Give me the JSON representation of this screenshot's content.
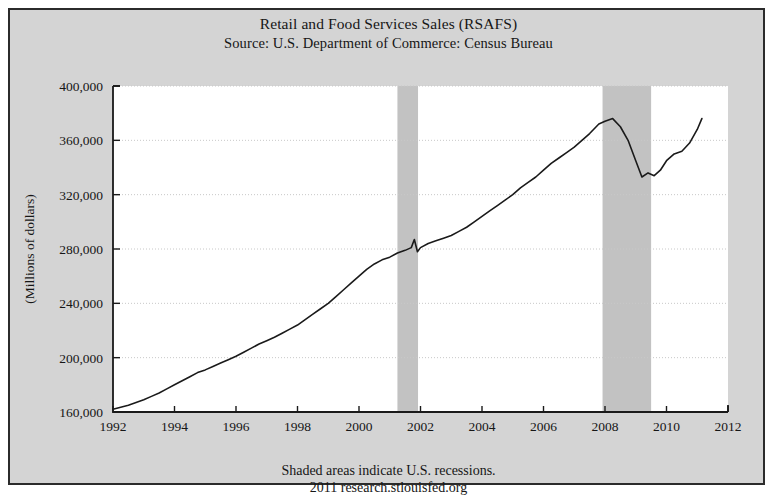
{
  "header": {
    "title": "Retail and Food Services Sales (RSAFS)",
    "source": "Source: U.S. Department of Commerce: Census Bureau"
  },
  "footer": {
    "note": "Shaded areas indicate U.S. recessions.",
    "attribution": "2011 research.stlouisfed.org"
  },
  "colors": {
    "figure_background": "#d4d4d4",
    "plot_background": "#ffffff",
    "line": "#1a1a1a",
    "recession_band": "#c2c2c2",
    "gridline": "#c8c8c8",
    "axis": "#1a1a1a",
    "text": "#161616"
  },
  "chart_data": {
    "type": "line",
    "title": "Retail and Food Services Sales (RSAFS)",
    "subtitle": "Source: U.S. Department of Commerce: Census Bureau",
    "xlabel": "",
    "ylabel": "(Millions of dollars)",
    "xlim": [
      1992,
      2012
    ],
    "ylim": [
      160000,
      400000
    ],
    "xticks": [
      1992,
      1994,
      1996,
      1998,
      2000,
      2002,
      2004,
      2006,
      2008,
      2010,
      2012
    ],
    "xtick_labels": [
      "1992",
      "1994",
      "1996",
      "1998",
      "2000",
      "2002",
      "2004",
      "2006",
      "2008",
      "2010",
      "2012"
    ],
    "yticks": [
      160000,
      200000,
      240000,
      280000,
      320000,
      360000,
      400000
    ],
    "ytick_labels": [
      "160,000",
      "200,000",
      "240,000",
      "280,000",
      "320,000",
      "360,000",
      "400,000"
    ],
    "grid": true,
    "legend": null,
    "series": [
      {
        "name": "RSAFS",
        "units": "Millions of dollars",
        "x": [
          1992.0,
          1992.25,
          1992.5,
          1992.75,
          1993.0,
          1993.25,
          1993.5,
          1993.75,
          1994.0,
          1994.25,
          1994.5,
          1994.75,
          1995.0,
          1995.25,
          1995.5,
          1995.75,
          1996.0,
          1996.25,
          1996.5,
          1996.75,
          1997.0,
          1997.25,
          1997.5,
          1997.75,
          1998.0,
          1998.25,
          1998.5,
          1998.75,
          1999.0,
          1999.25,
          1999.5,
          1999.75,
          2000.0,
          2000.25,
          2000.5,
          2000.75,
          2001.0,
          2001.25,
          2001.5,
          2001.7,
          2001.8,
          2001.9,
          2002.0,
          2002.25,
          2002.5,
          2002.75,
          2003.0,
          2003.25,
          2003.5,
          2003.75,
          2004.0,
          2004.25,
          2004.5,
          2004.75,
          2005.0,
          2005.25,
          2005.5,
          2005.75,
          2006.0,
          2006.25,
          2006.5,
          2006.75,
          2007.0,
          2007.25,
          2007.5,
          2007.8,
          2008.0,
          2008.25,
          2008.5,
          2008.75,
          2009.0,
          2009.2,
          2009.4,
          2009.6,
          2009.8,
          2010.0,
          2010.25,
          2010.5,
          2010.75,
          2011.0,
          2011.15
        ],
        "y": [
          162000,
          163500,
          165000,
          167000,
          169000,
          171500,
          174000,
          177000,
          180000,
          183000,
          186000,
          189000,
          191000,
          193500,
          196000,
          198500,
          201000,
          204000,
          207000,
          210000,
          212500,
          215000,
          218000,
          221000,
          224000,
          228000,
          232000,
          236000,
          240000,
          245000,
          250000,
          255000,
          260000,
          265000,
          269000,
          272000,
          274000,
          277000,
          279000,
          281000,
          287000,
          278000,
          281000,
          284000,
          286000,
          288000,
          290000,
          293000,
          296000,
          300000,
          304000,
          308000,
          312000,
          316000,
          320000,
          325000,
          329000,
          333000,
          338000,
          343000,
          347000,
          351000,
          355000,
          360000,
          365000,
          372000,
          374000,
          376000,
          370000,
          360000,
          345000,
          333000,
          336000,
          334000,
          338000,
          345000,
          350000,
          352000,
          358000,
          368000,
          376000
        ]
      }
    ],
    "recessions": [
      {
        "label": "2001 recession",
        "start": 2001.25,
        "end": 2001.92
      },
      {
        "label": "2008-2009 recession",
        "start": 2007.92,
        "end": 2009.5
      }
    ],
    "annotations": [
      {
        "text": "Shaded areas indicate U.S. recessions.",
        "position": "below-axis"
      },
      {
        "text": "2011 research.stlouisfed.org",
        "position": "below-axis"
      }
    ]
  }
}
